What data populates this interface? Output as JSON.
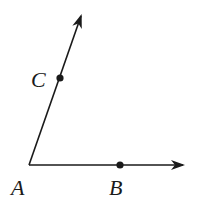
{
  "diagram": {
    "type": "angle",
    "colors": {
      "stroke": "#1a1a1a",
      "background": "#ffffff"
    },
    "vertex": {
      "label": "A",
      "x": 29,
      "y": 165
    },
    "points": {
      "B": {
        "label": "B",
        "x": 120,
        "y": 165
      },
      "C": {
        "label": "C",
        "x": 60,
        "y": 78
      }
    },
    "rays": [
      {
        "name": "ray-AB",
        "from": "A",
        "through": "B",
        "end_x": 183,
        "end_y": 165
      },
      {
        "name": "ray-AC",
        "from": "A",
        "through": "C",
        "end_x": 81,
        "end_y": 16
      }
    ],
    "labels": {
      "A": "A",
      "B": "B",
      "C": "C"
    }
  }
}
